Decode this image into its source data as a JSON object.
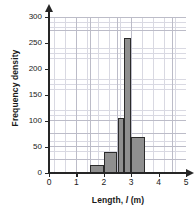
{
  "chart_data": {
    "type": "bar",
    "title": "",
    "subtitle": "",
    "xlabel_prefix": "Length, ",
    "xlabel_italic": "l",
    "xlabel_suffix": " (m)",
    "xlabel": "Length, l (m)",
    "ylabel": "Frequency density",
    "xlim": [
      0,
      5
    ],
    "ylim": [
      0,
      300
    ],
    "x_ticks": [
      0,
      1,
      2,
      3,
      4,
      5
    ],
    "x_tick_labels": [
      "0",
      "1",
      "2",
      "3",
      "4",
      "5"
    ],
    "y_ticks": [
      0,
      50,
      100,
      150,
      200,
      250,
      300
    ],
    "y_tick_labels": [
      "0",
      "50",
      "100",
      "150",
      "200",
      "250",
      "300"
    ],
    "grid": true,
    "grid_minor_step_x": 0.1,
    "grid_minor_step_y": 10,
    "grid_major_step_x": 0.5,
    "grid_major_step_y": 25,
    "legend": null,
    "bar_fill_color": "#8f8f8f",
    "bar_edge_color": "#2b2b2b",
    "grid_minor_color": "#d9d9e2",
    "grid_major_color": "#bcbcc8",
    "axis_color": "#262626",
    "bins": [
      {
        "label": "1.5-2.0",
        "x_start": 1.5,
        "x_end": 2.0,
        "value": 15
      },
      {
        "label": "2.0-2.5",
        "x_start": 2.0,
        "x_end": 2.5,
        "value": 40
      },
      {
        "label": "2.5-2.75",
        "x_start": 2.5,
        "x_end": 2.75,
        "value": 105
      },
      {
        "label": "2.75-3.0",
        "x_start": 2.75,
        "x_end": 3.0,
        "value": 260
      },
      {
        "label": "3.0-3.5",
        "x_start": 3.0,
        "x_end": 3.5,
        "value": 70
      }
    ],
    "categories": [
      "1.5-2.0",
      "2.0-2.5",
      "2.5-2.75",
      "2.75-3.0",
      "3.0-3.5"
    ],
    "values": [
      15,
      40,
      105,
      260,
      70
    ]
  }
}
